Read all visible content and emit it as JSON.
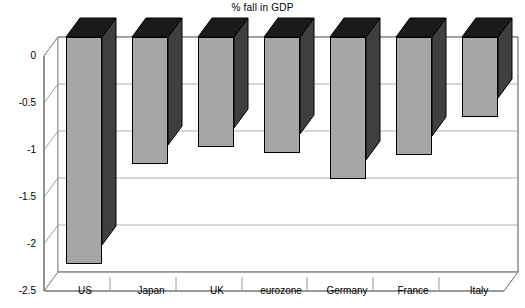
{
  "chart_data": {
    "type": "bar",
    "title": "% fall in GDP",
    "subtitle": "",
    "xlabel": "",
    "ylabel": "",
    "categories": [
      "US",
      "Japan",
      "UK",
      "eurozone",
      "Germany",
      "France",
      "Italy"
    ],
    "values": [
      -2.41,
      -1.35,
      -1.17,
      -1.23,
      -1.51,
      -1.26,
      -0.85
    ],
    "ylim": [
      -2.5,
      0
    ],
    "ytick_labels": [
      "0",
      "-0.5",
      "-1",
      "-1.5",
      "-2",
      "-2.5"
    ],
    "ytick_values": [
      0,
      -0.5,
      -1,
      -1.5,
      -2,
      -2.5
    ],
    "grid": true,
    "legend": false,
    "style": "3d-column",
    "colors": {
      "bar_face": "#a6a6a6",
      "bar_side": "#3f3f3f",
      "bar_top": "#1a1a1a",
      "outline": "#000000",
      "gridline": "#9a9a9a",
      "axis": "#6e6e6e",
      "background": "#ffffff"
    }
  }
}
